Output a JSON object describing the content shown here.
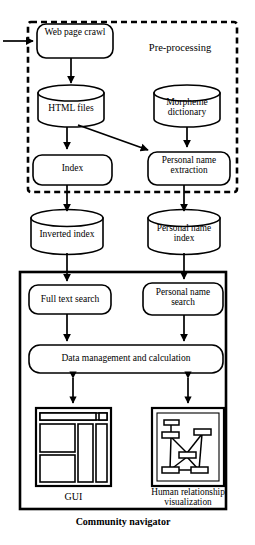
{
  "figure": {
    "type": "flowchart",
    "caption": "Community navigator",
    "regions": [
      {
        "id": "pre-processing",
        "label": "Pre-processing",
        "border": "dashed"
      },
      {
        "id": "community-navigator",
        "label": "Community navigator",
        "border": "solid"
      }
    ],
    "nodes": [
      {
        "id": "web-page-crawl",
        "label": "Web page crawl",
        "shape": "rounded-rect",
        "region": "pre-processing"
      },
      {
        "id": "html-files",
        "label": "HTML files",
        "shape": "cylinder",
        "region": "pre-processing"
      },
      {
        "id": "morpheme-dictionary",
        "label": "Morpheme dictionary",
        "shape": "cylinder",
        "region": "pre-processing"
      },
      {
        "id": "index",
        "label": "Index",
        "shape": "rounded-rect",
        "region": "pre-processing"
      },
      {
        "id": "personal-name-extraction",
        "label": "Personal name extraction",
        "shape": "rounded-rect",
        "region": "pre-processing"
      },
      {
        "id": "inverted-index",
        "label": "Inverted index",
        "shape": "cylinder",
        "region": "none"
      },
      {
        "id": "personal-name-index",
        "label": "Personal name index",
        "shape": "cylinder",
        "region": "none"
      },
      {
        "id": "full-text-search",
        "label": "Full text search",
        "shape": "rounded-rect",
        "region": "community-navigator"
      },
      {
        "id": "personal-name-search",
        "label": "Personal name search",
        "shape": "rounded-rect",
        "region": "community-navigator"
      },
      {
        "id": "data-management",
        "label": "Data management and calculation",
        "shape": "rounded-rect",
        "region": "community-navigator"
      },
      {
        "id": "gui",
        "label": "GUI",
        "shape": "screen-mockup",
        "region": "community-navigator"
      },
      {
        "id": "human-relationship-visualization",
        "label": "Human relationship visualization",
        "shape": "graph-mockup",
        "region": "community-navigator"
      }
    ],
    "edges": [
      {
        "from": "external-input",
        "to": "web-page-crawl",
        "style": "single"
      },
      {
        "from": "web-page-crawl",
        "to": "html-files",
        "style": "single"
      },
      {
        "from": "html-files",
        "to": "index",
        "style": "single"
      },
      {
        "from": "html-files",
        "to": "personal-name-extraction",
        "style": "single-diagonal"
      },
      {
        "from": "morpheme-dictionary",
        "to": "personal-name-extraction",
        "style": "single"
      },
      {
        "from": "index",
        "to": "inverted-index",
        "style": "single"
      },
      {
        "from": "personal-name-extraction",
        "to": "personal-name-index",
        "style": "single"
      },
      {
        "from": "inverted-index",
        "to": "full-text-search",
        "style": "single"
      },
      {
        "from": "personal-name-index",
        "to": "personal-name-search",
        "style": "single"
      },
      {
        "from": "full-text-search",
        "to": "data-management",
        "style": "single"
      },
      {
        "from": "personal-name-search",
        "to": "data-management",
        "style": "single"
      },
      {
        "from": "data-management",
        "to": "gui",
        "style": "double"
      },
      {
        "from": "data-management",
        "to": "human-relationship-visualization",
        "style": "double"
      }
    ]
  },
  "colors": {
    "stroke": "#000000",
    "background": "#ffffff"
  }
}
